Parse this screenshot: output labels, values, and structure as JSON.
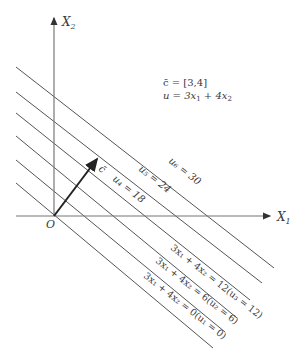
{
  "figure": {
    "axes": {
      "x_label": "X",
      "x_sub": "1",
      "y_label": "X",
      "y_sub": "2",
      "origin_label": "O"
    },
    "legend": {
      "c_line": "c̄ = [3,4]",
      "u_line_prefix": "u = 3x",
      "u_line_sub1": "1",
      "u_line_mid": " + 4x",
      "u_line_sub2": "2"
    },
    "vector": {
      "label": "c̄",
      "components": [
        3,
        4
      ]
    },
    "iso_lines": [
      {
        "value": 0,
        "label": "3x₁ + 4x₂ = 0(u₁ = 0)"
      },
      {
        "value": 6,
        "label": "3x₁ + 4x₂ = 6(u₂ = 6)"
      },
      {
        "value": 12,
        "label": "3x₁ + 4x₂ = 12(u₃ = 12)"
      },
      {
        "value": 18,
        "label": "u₄ = 18"
      },
      {
        "value": 24,
        "label": "u₅ = 24"
      },
      {
        "value": 30,
        "label": "u₆ = 30"
      }
    ],
    "colors": {
      "line": "#555555",
      "axis": "#777777",
      "vector": "#222222",
      "text": "#3a3a3a"
    }
  }
}
